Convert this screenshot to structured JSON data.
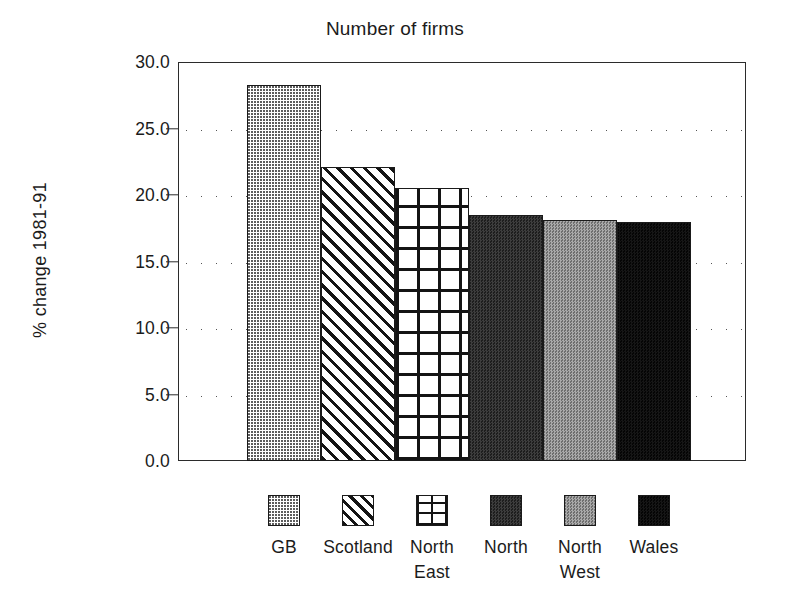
{
  "chart_data": {
    "type": "bar",
    "title": "Number of firms",
    "xlabel": "",
    "ylabel": "% change 1981-91",
    "categories": [
      "GB",
      "Scotland",
      "North East",
      "North",
      "North West",
      "Wales"
    ],
    "values": [
      28.3,
      22.1,
      20.5,
      18.5,
      18.1,
      18.0
    ],
    "ylim": [
      0.0,
      30.0
    ],
    "ytick_labels": [
      "30.0",
      "25.0",
      "20.0",
      "15.0",
      "10.0",
      "5.0",
      "0.0"
    ],
    "ytick_values": [
      30.0,
      25.0,
      20.0,
      15.0,
      10.0,
      5.0,
      0.0
    ],
    "grid": "horizontal-dotted",
    "legend_position": "bottom",
    "legend": [
      {
        "label": "GB",
        "pattern": "light-dotted"
      },
      {
        "label": "Scotland",
        "pattern": "diagonal-hatch"
      },
      {
        "label": "North\nEast",
        "pattern": "grid-crosshatch"
      },
      {
        "label": "North",
        "pattern": "dark-checker"
      },
      {
        "label": "North\nWest",
        "pattern": "mid-gray-checker"
      },
      {
        "label": "Wales",
        "pattern": "solid-black"
      }
    ],
    "colors": {
      "axis": "#2b2b2b",
      "text": "#1b1b1b",
      "background": "#ffffff",
      "grid": "#555555"
    }
  }
}
